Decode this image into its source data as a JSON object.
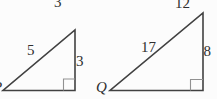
{
  "colors": {
    "background": "#fcfcfc",
    "line": "#414141",
    "right_angle_marker": "#919191",
    "text": "#2f2f2f"
  },
  "clipped_top_labels": {
    "left": "3",
    "right": "12"
  },
  "left_triangle": {
    "hypotenuse_label": "5",
    "vertical_side_label": "3",
    "bottom_left_vertex_partial": "P"
  },
  "right_triangle": {
    "hypotenuse_label": "17",
    "vertical_side_label": "8",
    "bottom_left_vertex": "Q"
  }
}
